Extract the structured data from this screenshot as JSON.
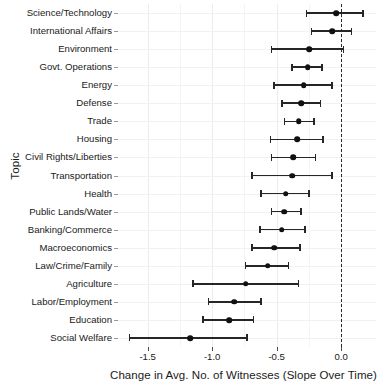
{
  "chart_data": {
    "type": "scatter",
    "subtype": "dot-and-whisker coefficient plot",
    "title": "",
    "xlabel": "Change in Avg. No. of Witnesses (Slope Over Time)",
    "ylabel": "Topic",
    "xlim": [
      -1.73,
      0.27
    ],
    "xticks": [
      -1.5,
      -1.0,
      -0.5,
      0.0
    ],
    "xtick_labels": [
      "-1.5",
      "-1.0",
      "-0.5",
      "0.0"
    ],
    "minor_xticks": [
      -1.25,
      -0.75,
      -0.25
    ],
    "grid": true,
    "legend": null,
    "reference_line": {
      "x": 0.0,
      "style": "dashed",
      "color": "#2b2b2b"
    },
    "point_color": "#111111",
    "error_color": "#262626",
    "categories": [
      "Science/Technology",
      "International Affairs",
      "Environment",
      "Govt. Operations",
      "Energy",
      "Defense",
      "Trade",
      "Housing",
      "Civil Rights/Liberties",
      "Transportation",
      "Health",
      "Public Lands/Water",
      "Banking/Commerce",
      "Macroeconomics",
      "Law/Crime/Family",
      "Agriculture",
      "Labor/Employment",
      "Education",
      "Social Welfare"
    ],
    "values": [
      -0.04,
      -0.07,
      -0.25,
      -0.26,
      -0.29,
      -0.31,
      -0.33,
      -0.34,
      -0.37,
      -0.38,
      -0.43,
      -0.44,
      -0.46,
      -0.52,
      -0.57,
      -0.74,
      -0.83,
      -0.87,
      -1.17
    ],
    "ci_low": [
      -0.27,
      -0.23,
      -0.54,
      -0.38,
      -0.52,
      -0.46,
      -0.44,
      -0.55,
      -0.54,
      -0.69,
      -0.62,
      -0.54,
      -0.63,
      -0.69,
      -0.74,
      -1.15,
      -1.03,
      -1.07,
      -1.64
    ],
    "ci_high": [
      0.17,
      0.08,
      0.02,
      -0.15,
      -0.07,
      -0.16,
      -0.21,
      -0.14,
      -0.2,
      -0.07,
      -0.25,
      -0.31,
      -0.28,
      -0.32,
      -0.41,
      -0.33,
      -0.62,
      -0.68,
      -0.73
    ]
  }
}
